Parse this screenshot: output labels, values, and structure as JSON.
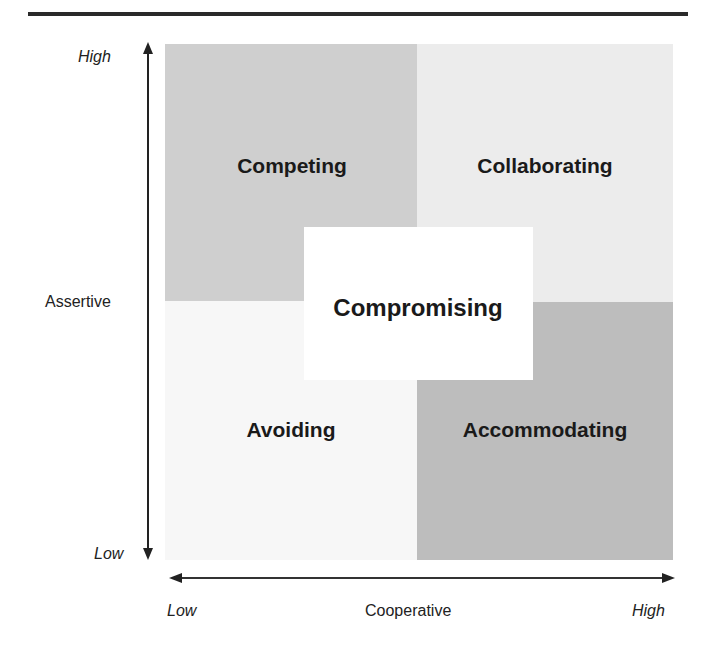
{
  "diagram": {
    "type": "quadrant-grid",
    "quadrants": {
      "top_left": {
        "label": "Competing",
        "color": "#cfcfcf"
      },
      "top_right": {
        "label": "Collaborating",
        "color": "#ececec"
      },
      "bottom_left": {
        "label": "Avoiding",
        "color": "#f7f7f7"
      },
      "bottom_right": {
        "label": "Accommodating",
        "color": "#bdbdbd"
      },
      "center": {
        "label": "Compromising",
        "color": "#ffffff"
      }
    },
    "y_axis": {
      "label": "Assertive",
      "high": "High",
      "low": "Low"
    },
    "x_axis": {
      "label": "Cooperative",
      "low": "Low",
      "high": "High"
    }
  }
}
